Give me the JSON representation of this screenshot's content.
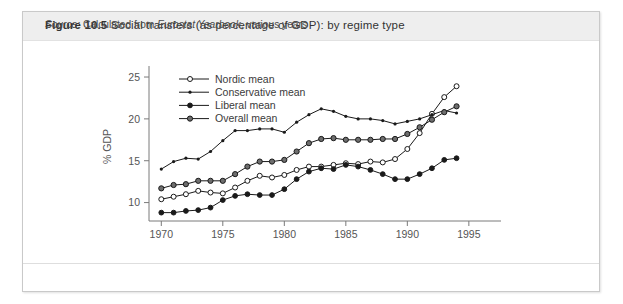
{
  "figure": {
    "number": "Figure 10.5",
    "title": "Social transfers (as percentage of GDP): by regime type",
    "source_prefix": "Source:",
    "source_text_a": "Calculated from",
    "source_text_italic": "Eurostat Yearbook",
    "source_text_b": ", various years"
  },
  "colors": {
    "line": "#1a1a1a",
    "axis": "#7a7a7a",
    "title_band": "#eeeeee",
    "frame": "#c9c9c9",
    "text": "#3a3a3a"
  },
  "chart_data": {
    "type": "line",
    "title": "Social transfers (as percentage of GDP): by regime type",
    "xlabel": "",
    "ylabel": "% GDP",
    "xlim": [
      1969,
      1995.5
    ],
    "ylim": [
      7.8,
      25.6
    ],
    "xticks": [
      1970,
      1975,
      1980,
      1985,
      1990,
      1995
    ],
    "yticks": [
      10,
      15,
      20,
      25
    ],
    "grid": false,
    "legend_position": "top-left-inside",
    "x": [
      1970,
      1971,
      1972,
      1973,
      1974,
      1975,
      1976,
      1977,
      1978,
      1979,
      1980,
      1981,
      1982,
      1983,
      1984,
      1985,
      1986,
      1987,
      1988,
      1989,
      1990,
      1991,
      1992,
      1993,
      1994
    ],
    "series": [
      {
        "name": "Nordic mean",
        "marker": "open-circle",
        "values": [
          10.4,
          10.7,
          11.0,
          11.4,
          11.2,
          11.1,
          11.8,
          12.6,
          13.2,
          13.0,
          13.3,
          13.9,
          14.3,
          14.3,
          14.5,
          14.7,
          14.6,
          14.9,
          14.8,
          15.2,
          16.4,
          18.3,
          20.6,
          22.6,
          23.9
        ]
      },
      {
        "name": "Conservative mean",
        "marker": "small-dot",
        "values": [
          14.0,
          14.9,
          15.3,
          15.2,
          16.1,
          17.4,
          18.6,
          18.6,
          18.8,
          18.8,
          18.4,
          19.6,
          20.5,
          21.2,
          20.9,
          20.3,
          20.0,
          20.0,
          19.8,
          19.4,
          19.7,
          20.0,
          20.5,
          21.0,
          20.7
        ]
      },
      {
        "name": "Liberal mean",
        "marker": "filled-circle",
        "values": [
          8.8,
          8.8,
          9.0,
          9.1,
          9.4,
          10.3,
          10.8,
          11.0,
          10.9,
          10.9,
          11.6,
          12.8,
          13.7,
          14.1,
          14.0,
          14.5,
          14.3,
          13.9,
          13.4,
          12.8,
          12.8,
          13.4,
          14.1,
          15.1,
          15.3
        ]
      },
      {
        "name": "Overall mean",
        "marker": "filled-circle-gray",
        "values": [
          11.7,
          12.1,
          12.2,
          12.6,
          12.6,
          12.6,
          13.4,
          14.3,
          14.9,
          14.9,
          15.1,
          16.1,
          17.1,
          17.6,
          17.7,
          17.5,
          17.5,
          17.5,
          17.6,
          17.6,
          18.2,
          19.0,
          19.9,
          20.8,
          21.5
        ]
      }
    ]
  }
}
